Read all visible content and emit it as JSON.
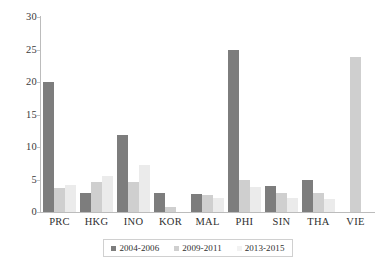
{
  "chart_data": {
    "type": "bar",
    "title": "",
    "subtitle": "",
    "xlabel": "",
    "ylabel": "",
    "ylim": [
      0,
      30
    ],
    "yticks": [
      0,
      5,
      10,
      15,
      20,
      25,
      30
    ],
    "grid": false,
    "legend_position": "bottom",
    "categories": [
      "PRC",
      "HKG",
      "INO",
      "KOR",
      "MAL",
      "PHI",
      "SIN",
      "THA",
      "VIE"
    ],
    "series": [
      {
        "name": "2004-2006",
        "color": "#7d7d7d",
        "values": [
          20.0,
          3.0,
          11.8,
          3.0,
          2.8,
          25.0,
          4.0,
          5.0,
          0.0
        ]
      },
      {
        "name": "2009-2011",
        "color": "#cfcfcf",
        "values": [
          3.7,
          4.6,
          4.6,
          0.8,
          2.6,
          4.9,
          3.0,
          3.0,
          23.8
        ]
      },
      {
        "name": "2013-2015",
        "color": "#ebebeb",
        "values": [
          4.1,
          5.6,
          7.3,
          0.0,
          2.2,
          3.9,
          2.2,
          2.0,
          0.0
        ]
      }
    ]
  },
  "axis": {
    "y_tick_labels": [
      "0",
      "5",
      "10",
      "15",
      "20",
      "25",
      "30"
    ]
  },
  "legend": {
    "items": [
      {
        "label": "2004-2006"
      },
      {
        "label": "2009-2011"
      },
      {
        "label": "2013-2015"
      }
    ]
  }
}
